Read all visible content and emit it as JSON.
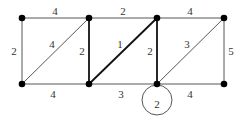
{
  "graph": {
    "nodes": [
      {
        "id": "A",
        "x": 22,
        "y": 18
      },
      {
        "id": "B",
        "x": 89,
        "y": 18
      },
      {
        "id": "C",
        "x": 157,
        "y": 18
      },
      {
        "id": "D",
        "x": 224,
        "y": 18
      },
      {
        "id": "E",
        "x": 22,
        "y": 84
      },
      {
        "id": "F",
        "x": 89,
        "y": 84
      },
      {
        "id": "G",
        "x": 157,
        "y": 84
      },
      {
        "id": "H",
        "x": 224,
        "y": 84
      }
    ],
    "edges": [
      {
        "from": "A",
        "to": "B",
        "weight": "4",
        "lx": 55,
        "ly": 12,
        "bold": false
      },
      {
        "from": "B",
        "to": "C",
        "weight": "2",
        "lx": 123,
        "ly": 12,
        "bold": false
      },
      {
        "from": "C",
        "to": "D",
        "weight": "4",
        "lx": 190,
        "ly": 12,
        "bold": false
      },
      {
        "from": "A",
        "to": "E",
        "weight": "2",
        "lx": 14,
        "ly": 52,
        "bold": false
      },
      {
        "from": "E",
        "to": "B",
        "weight": "4",
        "lx": 52,
        "ly": 45,
        "bold": false
      },
      {
        "from": "B",
        "to": "F",
        "weight": "2",
        "lx": 82,
        "ly": 52,
        "bold": true
      },
      {
        "from": "F",
        "to": "C",
        "weight": "1",
        "lx": 120,
        "ly": 45,
        "bold": true
      },
      {
        "from": "C",
        "to": "G",
        "weight": "2",
        "lx": 150,
        "ly": 52,
        "bold": true
      },
      {
        "from": "G",
        "to": "D",
        "weight": "3",
        "lx": 187,
        "ly": 45,
        "bold": false
      },
      {
        "from": "D",
        "to": "H",
        "weight": "5",
        "lx": 231,
        "ly": 52,
        "bold": false
      },
      {
        "from": "E",
        "to": "F",
        "weight": "4",
        "lx": 53,
        "ly": 95,
        "bold": false
      },
      {
        "from": "F",
        "to": "G",
        "weight": "3",
        "lx": 121,
        "ly": 95,
        "bold": false
      },
      {
        "from": "G",
        "to": "H",
        "weight": "4",
        "lx": 190,
        "ly": 95,
        "bold": false
      }
    ],
    "loop": {
      "node": "G",
      "weight": "2",
      "cx": 157,
      "cy": 100,
      "r": 15
    }
  }
}
